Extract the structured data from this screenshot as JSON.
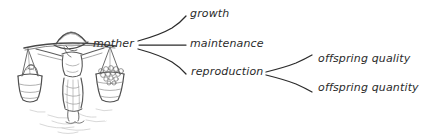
{
  "figure": {
    "type": "hand-drawn-concept-diagram",
    "illustration": {
      "name": "woman-carrying-yoke-with-two-baskets",
      "description": "pencil sketch of a woman in a conical hat carrying a shoulder pole with a hanging basket on each side",
      "style": "graphite pencil sketch",
      "ink_color": "#555555"
    },
    "line_color": "#2b2b2b"
  },
  "diagram": {
    "root": {
      "id": "mother",
      "label": "mother"
    },
    "branches": [
      {
        "id": "growth",
        "label": "growth",
        "children": []
      },
      {
        "id": "maintenance",
        "label": "maintenance",
        "children": []
      },
      {
        "id": "reproduction",
        "label": "reproduction",
        "children": [
          {
            "id": "offspring-quality",
            "label": "offspring quality"
          },
          {
            "id": "offspring-quantity",
            "label": "offspring quantity"
          }
        ]
      }
    ]
  }
}
